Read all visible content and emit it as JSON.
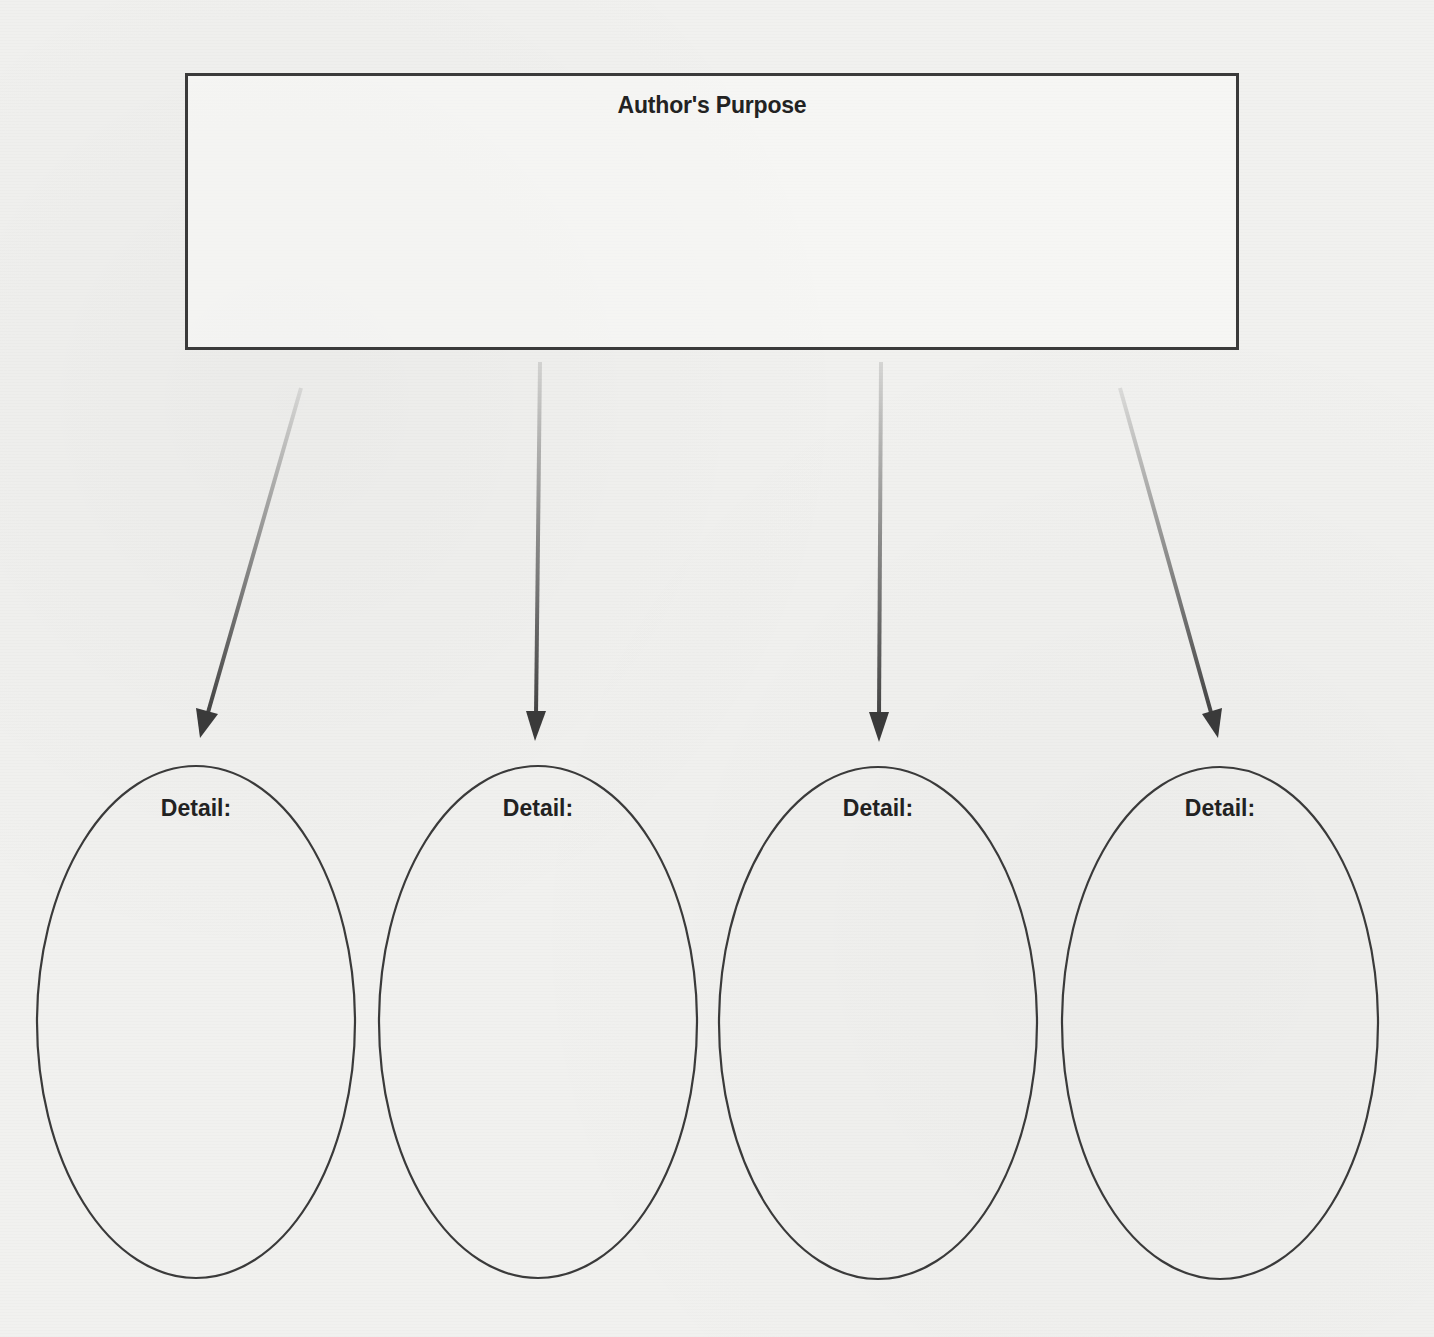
{
  "organizer": {
    "title": "Author's Purpose",
    "details": [
      {
        "label": "Detail:",
        "value": ""
      },
      {
        "label": "Detail:",
        "value": ""
      },
      {
        "label": "Detail:",
        "value": ""
      },
      {
        "label": "Detail:",
        "value": ""
      }
    ]
  },
  "colors": {
    "line": "#3a3a3a",
    "paper": "#f1f1ef",
    "text": "#222222"
  }
}
